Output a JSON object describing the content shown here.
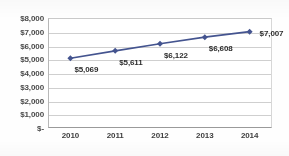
{
  "chart_data": {
    "type": "line",
    "title": "",
    "xlabel": "",
    "ylabel": "",
    "categories": [
      "2010",
      "2011",
      "2012",
      "2013",
      "2014"
    ],
    "values": [
      5069,
      5611,
      6122,
      6608,
      7007
    ],
    "point_labels": [
      "$5,069",
      "$5,611",
      "$6,122",
      "$6,608",
      "$7,007"
    ],
    "ylim": [
      0,
      8000
    ],
    "yticks": [
      0,
      1000,
      2000,
      3000,
      4000,
      5000,
      6000,
      7000,
      8000
    ],
    "ytick_labels": [
      "$-",
      "$1,000",
      "$2,000",
      "$3,000",
      "$4,000",
      "$5,000",
      "$6,000",
      "$7,000",
      "$8,000"
    ],
    "grid": true,
    "legend": "none",
    "series": [
      {
        "name": "series-1",
        "values": [
          5069,
          5611,
          6122,
          6608,
          7007
        ],
        "color": "#44548f",
        "marker": "diamond"
      }
    ],
    "colors": {
      "line": "#44548f",
      "marker": "#44548f",
      "gridline": "#cfcfcf",
      "axis": "#9a9a9a",
      "tick_text": "#4a4a4a",
      "label_text": "#2e2e2e",
      "background": "#ffffff"
    }
  }
}
